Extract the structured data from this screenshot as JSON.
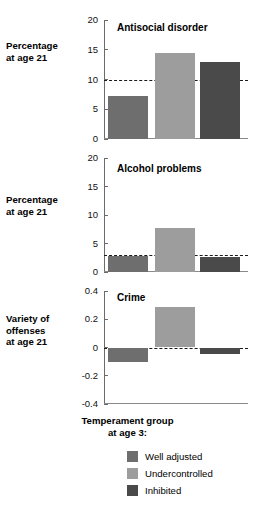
{
  "chart_data": {
    "type": "bar",
    "title": "",
    "xlabel": "Temperament group at age 3:",
    "categories": [
      "Well adjusted",
      "Undercontrolled",
      "Inhibited"
    ],
    "legend_position": "bottom",
    "grid": false,
    "panels": [
      {
        "title": "Antisocial disorder",
        "ylabel": "Percentage\nat age 21",
        "ylabel_lines": [
          "Percentage",
          "at age 21"
        ],
        "ylim": [
          0,
          20
        ],
        "yticks": [
          0,
          5,
          10,
          15,
          20
        ],
        "ytick_labels": [
          "0",
          "5",
          "10",
          "15",
          "20"
        ],
        "reference_line": 10,
        "values": [
          7.2,
          14.4,
          13.0
        ]
      },
      {
        "title": "Alcohol problems",
        "ylabel": "Percentage\nat age 21",
        "ylabel_lines": [
          "Percentage",
          "at age 21"
        ],
        "ylim": [
          0,
          20
        ],
        "yticks": [
          0,
          5,
          10,
          15,
          20
        ],
        "ytick_labels": [
          "0",
          "5",
          "10",
          "15",
          "20"
        ],
        "reference_line": 3.0,
        "values": [
          2.8,
          7.8,
          2.6
        ]
      },
      {
        "title": "Crime",
        "ylabel": "Variety of\noffenses\nat age 21",
        "ylabel_lines": [
          "Variety of",
          "offenses",
          "at age 21"
        ],
        "ylim": [
          -0.4,
          0.4
        ],
        "yticks": [
          -0.4,
          -0.2,
          0,
          0.2,
          0.4
        ],
        "ytick_labels": [
          "-0.4",
          "-0.2",
          "0",
          "0.2",
          "0.4"
        ],
        "reference_line": 0,
        "values": [
          -0.1,
          0.285,
          -0.045
        ]
      }
    ],
    "series_colors": [
      "#6e6e6e",
      "#9d9d9d",
      "#4a4a4a"
    ]
  },
  "panel0": {
    "title": "Antisocial disorder",
    "ylabel_l1": "Percentage",
    "ylabel_l2": "at age 21",
    "t0": "0",
    "t1": "5",
    "t2": "10",
    "t3": "15",
    "t4": "20"
  },
  "panel1": {
    "title": "Alcohol problems",
    "ylabel_l1": "Percentage",
    "ylabel_l2": "at age 21",
    "t0": "0",
    "t1": "5",
    "t2": "10",
    "t3": "15",
    "t4": "20"
  },
  "panel2": {
    "title": "Crime",
    "ylabel_l1": "Variety of",
    "ylabel_l2": "offenses",
    "ylabel_l3": "at age 21",
    "t0": "-0.4",
    "t1": "-0.2",
    "t2": "0",
    "t3": "0.2",
    "t4": "0.4"
  },
  "legend": {
    "title_l1": "Temperament group",
    "title_l2": "at age 3:",
    "items": [
      {
        "label": "Well adjusted",
        "color": "#6e6e6e"
      },
      {
        "label": "Undercontrolled",
        "color": "#9d9d9d"
      },
      {
        "label": "Inhibited",
        "color": "#4a4a4a"
      }
    ]
  }
}
